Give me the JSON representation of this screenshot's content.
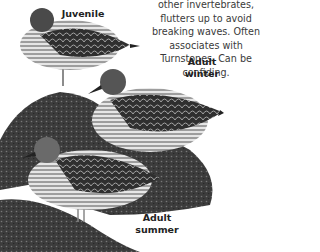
{
  "description": {
    "lines": [
      "other invertebrates, flutters up to avoid",
      "breaking waves. Often associates with",
      "Turnstones. Can be confiding."
    ]
  },
  "labels": {
    "juvenile": "Juvenile",
    "adult_winter": [
      "Adult",
      "winter"
    ],
    "adult_summer": [
      "Adult",
      "summer"
    ]
  },
  "illustrations": [
    {
      "name": "juvenile-bird",
      "plumage": "scaly dark upperparts, pale streaked breast"
    },
    {
      "name": "adult-winter-bird",
      "plumage": "grey-brown, scaly wings"
    },
    {
      "name": "adult-summer-bird",
      "plumage": "scalloped dark wings, streaked breast"
    }
  ]
}
